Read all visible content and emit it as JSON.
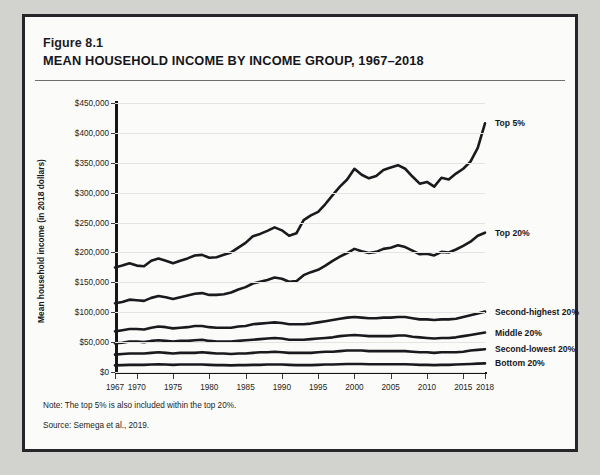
{
  "figure": {
    "number": "Figure 8.1",
    "title": "MEAN HOUSEHOLD INCOME BY INCOME GROUP, 1967–2018",
    "note": "Note: The top 5% is also included within the top 20%.",
    "source": "Source: Semega et al., 2019."
  },
  "colors": {
    "line": "#1a1a1e",
    "grid": "#e4e4e2",
    "axis": "#16161a",
    "card_bg": "#fbfbf9",
    "page_bg": "#d2d2ce",
    "border": "#26262a"
  },
  "chart_data": {
    "type": "line",
    "title": "MEAN HOUSEHOLD INCOME BY INCOME GROUP, 1967–2018",
    "xlabel": "",
    "ylabel": "Mean household income (in 2018 dollars)",
    "xlim": [
      1967,
      2018
    ],
    "ylim": [
      0,
      450000
    ],
    "grid": true,
    "legend_position": "right-inline",
    "ytick_labels": [
      "$0",
      "$50,000",
      "$100,000",
      "$150,000",
      "$200,000",
      "$250,000",
      "$300,000",
      "$350,000",
      "$400,000",
      "$450,000"
    ],
    "ytick_values": [
      0,
      50000,
      100000,
      150000,
      200000,
      250000,
      300000,
      350000,
      400000,
      450000
    ],
    "xtick_labels": [
      "1967",
      "1970",
      "1975",
      "1980",
      "1985",
      "1990",
      "1995",
      "2000",
      "2005",
      "2010",
      "2015",
      "2018"
    ],
    "xtick_values": [
      1967,
      1970,
      1975,
      1980,
      1985,
      1990,
      1995,
      2000,
      2005,
      2010,
      2015,
      2018
    ],
    "x": [
      1967,
      1968,
      1969,
      1970,
      1971,
      1972,
      1973,
      1974,
      1975,
      1976,
      1977,
      1978,
      1979,
      1980,
      1981,
      1982,
      1983,
      1984,
      1985,
      1986,
      1987,
      1988,
      1989,
      1990,
      1991,
      1992,
      1993,
      1994,
      1995,
      1996,
      1997,
      1998,
      1999,
      2000,
      2001,
      2002,
      2003,
      2004,
      2005,
      2006,
      2007,
      2008,
      2009,
      2010,
      2011,
      2012,
      2013,
      2014,
      2015,
      2016,
      2017,
      2018
    ],
    "series": [
      {
        "name": "Top 5%",
        "label": "Top 5%",
        "values": [
          175000,
          178000,
          182000,
          178000,
          177000,
          186000,
          190000,
          186000,
          182000,
          186000,
          190000,
          195000,
          196000,
          191000,
          192000,
          196000,
          200000,
          208000,
          216000,
          227000,
          231000,
          236000,
          242000,
          237000,
          228000,
          232000,
          254000,
          262000,
          268000,
          281000,
          296000,
          310000,
          322000,
          340000,
          330000,
          324000,
          328000,
          338000,
          342000,
          346000,
          340000,
          327000,
          315000,
          318000,
          310000,
          325000,
          322000,
          332000,
          340000,
          352000,
          375000,
          416000
        ]
      },
      {
        "name": "Top 20%",
        "label": "Top 20%",
        "values": [
          115000,
          117000,
          121000,
          120000,
          119000,
          124000,
          127000,
          125000,
          122000,
          125000,
          128000,
          131000,
          132000,
          129000,
          129000,
          130000,
          133000,
          138000,
          142000,
          148000,
          151000,
          154000,
          158000,
          156000,
          151000,
          152000,
          162000,
          167000,
          171000,
          178000,
          186000,
          193000,
          199000,
          206000,
          202000,
          199000,
          201000,
          206000,
          208000,
          212000,
          209000,
          203000,
          197000,
          198000,
          195000,
          201000,
          200000,
          205000,
          211000,
          218000,
          228000,
          233000
        ]
      },
      {
        "name": "Second-highest 20%",
        "label": "Second-highest 20%",
        "values": [
          68000,
          70000,
          72000,
          72000,
          71000,
          74000,
          76000,
          75000,
          73000,
          74000,
          75000,
          77000,
          77000,
          75000,
          74000,
          74000,
          74000,
          76000,
          77000,
          80000,
          81000,
          82000,
          83000,
          82000,
          80000,
          80000,
          80000,
          81000,
          83000,
          85000,
          87000,
          89000,
          91000,
          92000,
          91000,
          90000,
          90000,
          91000,
          91000,
          92000,
          92000,
          90000,
          88000,
          88000,
          87000,
          88000,
          88000,
          89000,
          92000,
          95000,
          98000,
          101000
        ]
      },
      {
        "name": "Middle 20%",
        "label": "Middle 20%",
        "values": [
          48000,
          49000,
          51000,
          51000,
          50000,
          52000,
          53000,
          52000,
          51000,
          52000,
          52000,
          53000,
          54000,
          52000,
          51000,
          51000,
          51000,
          52000,
          53000,
          54000,
          55000,
          56000,
          57000,
          56000,
          54000,
          54000,
          54000,
          55000,
          56000,
          57000,
          58000,
          60000,
          61000,
          62000,
          61000,
          60000,
          60000,
          60000,
          60000,
          61000,
          61000,
          59000,
          58000,
          57000,
          56000,
          57000,
          57000,
          58000,
          60000,
          62000,
          64000,
          66000
        ]
      },
      {
        "name": "Second-lowest 20%",
        "label": "Second-lowest 20%",
        "values": [
          29000,
          30000,
          31000,
          31000,
          31000,
          32000,
          33000,
          32000,
          31000,
          32000,
          32000,
          32000,
          33000,
          32000,
          31000,
          31000,
          30000,
          31000,
          31000,
          32000,
          33000,
          33000,
          34000,
          33000,
          32000,
          32000,
          32000,
          32000,
          33000,
          34000,
          34000,
          35000,
          36000,
          36000,
          36000,
          35000,
          35000,
          35000,
          35000,
          35000,
          35000,
          34000,
          33000,
          33000,
          32000,
          33000,
          33000,
          33000,
          34000,
          36000,
          37000,
          38000
        ]
      },
      {
        "name": "Bottom 20%",
        "label": "Bottom 20%",
        "values": [
          11000,
          11500,
          12000,
          12000,
          12000,
          12500,
          13000,
          12500,
          12000,
          12500,
          12500,
          12500,
          12500,
          12000,
          11500,
          11500,
          11000,
          11500,
          11500,
          12000,
          12000,
          12500,
          12500,
          12500,
          12000,
          11500,
          11500,
          11500,
          12000,
          12500,
          12500,
          13000,
          13500,
          13500,
          13500,
          13000,
          13000,
          13000,
          13000,
          13000,
          13000,
          12500,
          12000,
          12000,
          11500,
          12000,
          12000,
          12500,
          13000,
          13500,
          14000,
          14500
        ]
      }
    ]
  }
}
